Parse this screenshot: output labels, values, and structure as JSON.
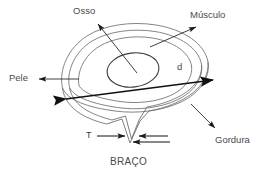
{
  "figure": {
    "title_caption": "BRAÇO",
    "labels": {
      "bone": "Osso",
      "muscle": "Músculo",
      "skin": "Pele",
      "fat": "Gordura",
      "diameter_symbol": "d",
      "thickness_symbol": "T"
    },
    "colors": {
      "outline": "#6e6e6e",
      "arrow": "#1a1a1a",
      "text": "#4a4a4a",
      "background": "#ffffff"
    }
  }
}
